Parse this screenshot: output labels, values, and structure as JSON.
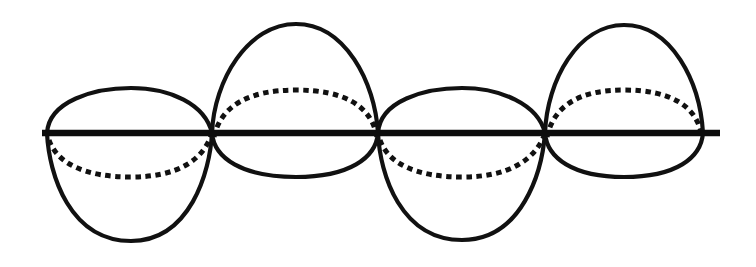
{
  "figure": {
    "background_color": "#ffffff",
    "stroke_color": "#111111",
    "axis_color": "#0d0d0d",
    "width": 756,
    "height": 267,
    "axis": {
      "label": "horizontal axis",
      "y": 133,
      "x_start": 42,
      "x_end": 720,
      "thickness": 6.4
    },
    "nodes": [
      47,
      212,
      378,
      545,
      703
    ],
    "lobes": [
      {
        "index": 1,
        "x_start": 47,
        "x_end": 212,
        "upper_extent": 89,
        "lower_extent": 241,
        "orientation": "short-up-tall-down",
        "dashed_arc_side": "below",
        "dashed_arc_extent": 177
      },
      {
        "index": 2,
        "x_start": 212,
        "x_end": 378,
        "upper_extent": 24,
        "lower_extent": 177,
        "orientation": "tall-up-short-down",
        "dashed_arc_side": "above",
        "dashed_arc_extent": 90
      },
      {
        "index": 3,
        "x_start": 378,
        "x_end": 545,
        "upper_extent": 89,
        "lower_extent": 240,
        "orientation": "short-up-tall-down",
        "dashed_arc_side": "below",
        "dashed_arc_extent": 177
      },
      {
        "index": 4,
        "x_start": 545,
        "x_end": 703,
        "upper_extent": 25,
        "lower_extent": 177,
        "orientation": "tall-up-short-down",
        "dashed_arc_side": "above",
        "dashed_arc_extent": 90
      }
    ],
    "paths": {
      "axis": "M 42 133 L 720 133",
      "lobe1_upper": "M 47 133 C 49 101 94 88 131 88 C 170 88 205 104 212 133",
      "lobe1_lower": "M 47 133 C 49 175 70 241 131 241 C 190 241 210 172 212 133",
      "lobe1_dashed": "M 49 140 C 57 163 84 177 131 177 C 178 177 202 160 211 136",
      "lobe2_upper": "M 212 133 C 214 80 248 24 296 24 C 345 24 375 82 378 133",
      "lobe2_lower": "M 212 133 C 214 158 242 177 296 177 C 349 177 376 158 378 133",
      "lobe2_dashed": "M 214 137 C 221 105 250 90 296 90 C 343 90 372 105 377 138",
      "lobe3_upper": "M 378 133 C 380 101 424 88 462 88 C 500 88 538 104 545 133",
      "lobe3_lower": "M 378 133 C 380 175 401 240 462 240 C 522 240 542 172 545 133",
      "lobe3_dashed": "M 380 140 C 388 163 415 177 462 177 C 509 177 534 160 544 136",
      "lobe4_upper": "M 545 133 C 547 80 578 25 624 25 C 672 25 700 82 703 133",
      "lobe4_lower": "M 545 133 C 547 158 573 177 624 177 C 676 177 701 158 703 133",
      "lobe4_dashed": "M 547 137 C 554 105 580 90 624 90 C 669 90 698 105 702 138"
    }
  }
}
